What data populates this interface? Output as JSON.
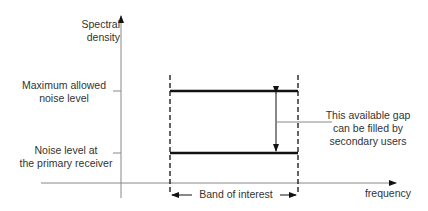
{
  "diagram": {
    "y_axis_label_line1": "Spectral",
    "y_axis_label_line2": "density",
    "x_axis_label": "frequency",
    "max_level_line1": "Maximum allowed",
    "max_level_line2": "noise level",
    "noise_level_line1": "Noise level at",
    "noise_level_line2": "the primary receiver",
    "gap_line1": "This available gap",
    "gap_line2": "can be filled by",
    "gap_line3": "secondary users",
    "band_label": "Band of interest",
    "colors": {
      "lines": "#111111",
      "axes": "#888888",
      "text": "#333333"
    }
  }
}
